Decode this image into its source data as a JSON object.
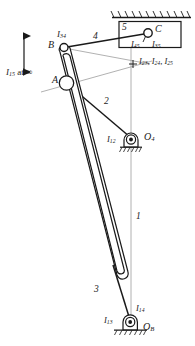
{
  "figure": {
    "type": "kinematic-linkage-instant-center-diagram",
    "ink_color": "#1a1a1a",
    "construction_line_color": "#9a9a9a",
    "fill_color": "#ffffff"
  },
  "labels": {
    "i15_at_infinity": {
      "I": "I",
      "sub": "15",
      "text": " at ∞"
    },
    "i34": {
      "I": "I",
      "sub": "34"
    },
    "i45": {
      "I": "I",
      "sub": "45"
    },
    "i35": {
      "I": "I",
      "sub": "35"
    },
    "i12": {
      "I": "I",
      "sub": "12"
    },
    "i13": {
      "I": "I",
      "sub": "13"
    },
    "i14": {
      "I": "I",
      "sub": "14"
    },
    "i23_i24_i25": {
      "t1": "I",
      "s1": "23",
      "c1": ", ",
      "t2": "I",
      "s2": "24",
      "c2": ", ",
      "t3": "I",
      "s3": "25"
    },
    "point_a": "A",
    "point_b": "B",
    "point_c": "C",
    "o4": {
      "O": "O",
      "sub": "4"
    },
    "ob": {
      "O": "O",
      "sub": "B"
    },
    "link_1": "1",
    "link_2": "2",
    "link_3": "3",
    "link_4": "4",
    "link_5": "5"
  },
  "geometry": {
    "point_b": [
      63,
      47
    ],
    "point_a": [
      66,
      83
    ],
    "point_c": [
      148,
      33
    ],
    "pivot_o4": [
      131,
      139
    ],
    "pivot_ob": [
      130,
      322
    ],
    "slider_box": [
      119,
      22,
      62,
      26
    ],
    "ground_hatch_top": {
      "x1": 113,
      "x2": 190,
      "y": 17
    },
    "ground_hatch_ob": {
      "x1": 114,
      "x2": 148,
      "y": 332
    },
    "ic_point_2345": [
      133,
      64
    ],
    "vertical_ground_line": {
      "x": 131,
      "y1": 33,
      "y2": 322
    },
    "arrow_axis": {
      "x": 24,
      "y1": 30,
      "y2": 78
    }
  }
}
